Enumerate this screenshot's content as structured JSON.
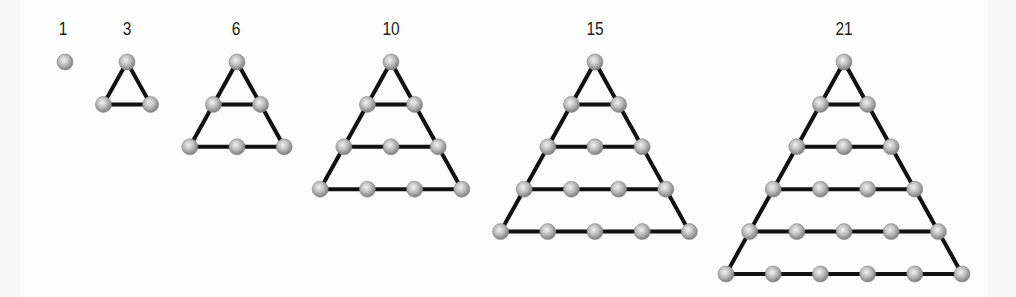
{
  "diagram": {
    "colors": {
      "background": "#fdfdfd",
      "edge_band": "#f7f7f7",
      "line": "#111111",
      "node_highlight": "#f2f2f2",
      "node_mid": "#bdbdbd",
      "node_edge": "#7d7d7d",
      "label": "#1e1e1e"
    },
    "geometry": {
      "top_y": 62,
      "row_spacing": 42.4,
      "node_spacing": 47.2,
      "node_radius": 8,
      "line_width": 4
    },
    "figures": [
      {
        "label": "1",
        "rows": 1,
        "apex_x": 65,
        "label_x": 63
      },
      {
        "label": "3",
        "rows": 2,
        "apex_x": 127,
        "label_x": 127
      },
      {
        "label": "6",
        "rows": 3,
        "apex_x": 237,
        "label_x": 236
      },
      {
        "label": "10",
        "rows": 4,
        "apex_x": 391,
        "label_x": 391
      },
      {
        "label": "15",
        "rows": 5,
        "apex_x": 595,
        "label_x": 595
      },
      {
        "label": "21",
        "rows": 6,
        "apex_x": 844,
        "label_x": 844
      }
    ]
  }
}
